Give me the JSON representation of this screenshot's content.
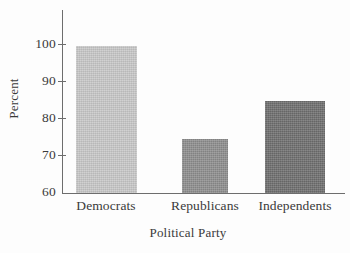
{
  "chart_data": {
    "type": "bar",
    "title": "",
    "title_note": "title is cropped off the top edge of the screenshot",
    "xlabel": "Political Party",
    "ylabel": "Percent",
    "categories": [
      "Democrats",
      "Republicans",
      "Independents"
    ],
    "values": [
      99,
      74.5,
      84.5
    ],
    "ylim": [
      60,
      100
    ],
    "yticks": [
      60,
      70,
      80,
      90,
      100
    ],
    "ytick_labels": [
      "60",
      "70",
      "80",
      "90",
      "100"
    ],
    "grid": false,
    "legend": false,
    "bar_colors": [
      "#c8c8c8",
      "#8e8e8e",
      "#6e6e6e"
    ],
    "axis_color": "#6d6d6d"
  },
  "axis": {
    "y_title": "Percent",
    "x_title": "Political Party",
    "ticks": [
      {
        "label": "100",
        "value": 100,
        "y": 44
      },
      {
        "label": "90",
        "value": 90,
        "y": 81
      },
      {
        "label": "80",
        "value": 80,
        "y": 118
      },
      {
        "label": "70",
        "value": 70,
        "y": 155
      },
      {
        "label": "60",
        "value": 60,
        "y": 192
      }
    ]
  },
  "bars": [
    {
      "label": "Democrats",
      "value": 99,
      "color": "#c8c8c8",
      "x": 76,
      "width": 61,
      "height": 147,
      "label_center": 106
    },
    {
      "label": "Republicans",
      "value": 74.5,
      "color": "#8e8e8e",
      "x": 182,
      "width": 46,
      "height": 54,
      "label_center": 205
    },
    {
      "label": "Independents",
      "value": 84.5,
      "color": "#6e6e6e",
      "x": 265,
      "width": 60,
      "height": 92,
      "label_center": 295
    }
  ],
  "title_sliver": {
    "text": ""
  }
}
